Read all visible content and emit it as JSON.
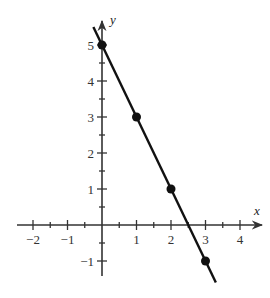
{
  "chart_data": {
    "type": "line",
    "title": "",
    "xlabel": "x",
    "ylabel": "y",
    "xlim": [
      -2.5,
      4.6
    ],
    "ylim": [
      -1.5,
      5.7
    ],
    "grid": false,
    "x_ticks": [
      -2,
      -1,
      1,
      2,
      3,
      4
    ],
    "x_minor_step": 0.5,
    "y_ticks": [
      -1,
      1,
      2,
      3,
      4,
      5
    ],
    "y_minor_step": 0.5,
    "series": [
      {
        "name": "y = -2x + 5",
        "kind": "line",
        "x": [
          -0.25,
          3.3
        ],
        "y": [
          5.5,
          -1.6
        ]
      },
      {
        "name": "points",
        "kind": "scatter",
        "x": [
          0,
          1,
          2,
          3
        ],
        "y": [
          5,
          3,
          1,
          -1
        ]
      }
    ],
    "colors": {
      "axis": "#333333",
      "line": "#111111",
      "points": "#111111",
      "labels": "#333333"
    }
  }
}
